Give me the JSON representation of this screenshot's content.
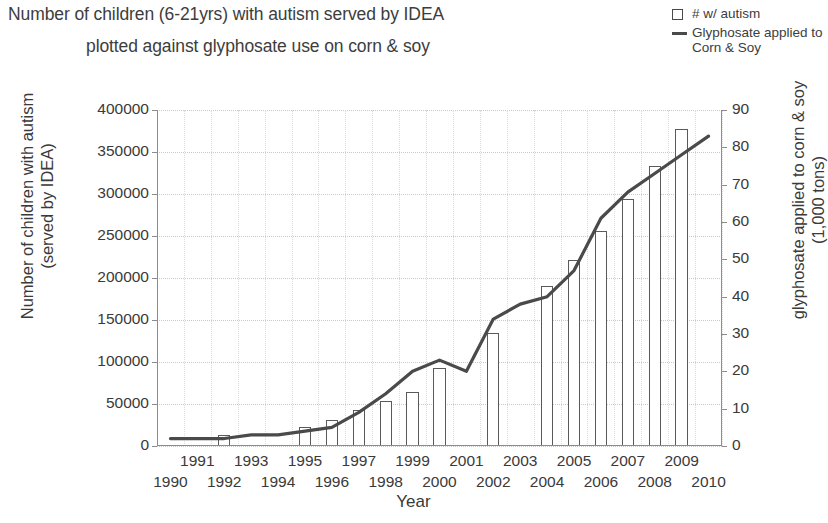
{
  "title": {
    "line1": "Number of children (6-21yrs) with autism served by IDEA",
    "line2": "plotted against glyphosate use on corn & soy"
  },
  "legend": {
    "items": [
      {
        "symbol": "open-square",
        "label": "# w/ autism"
      },
      {
        "symbol": "line",
        "label": "Glyphosate applied to\nCorn & Soy"
      }
    ]
  },
  "axes": {
    "x_title": "Year",
    "y_left_title": "Number of children with autism\n(served by IDEA)",
    "y_right_title": "glyphosate applied to corn & soy\n(1,000 tons)",
    "y_left_ticks": [
      "0",
      "50000",
      "100000",
      "150000",
      "200000",
      "250000",
      "300000",
      "350000",
      "400000"
    ],
    "y_right_ticks": [
      "0",
      "10",
      "20",
      "30",
      "40",
      "50",
      "60",
      "70",
      "80",
      "90"
    ],
    "x_ticks": [
      "1990",
      "1991",
      "1992",
      "1993",
      "1994",
      "1995",
      "1996",
      "1997",
      "1998",
      "1999",
      "2000",
      "2001",
      "2002",
      "2003",
      "2004",
      "2005",
      "2006",
      "2007",
      "2008",
      "2009",
      "2010"
    ]
  },
  "colors": {
    "line": "#4a4a4a",
    "bar_stroke": "#5a5a5a",
    "bar_fill": "#ffffff",
    "grid": "#c9c9c9",
    "axis": "#8c8c8c",
    "text": "#3a3a3a"
  },
  "chart_data": {
    "type": "bar",
    "title": "Number of children (6-21yrs) with autism served by IDEA plotted against glyphosate use on corn & soy",
    "xlabel": "Year",
    "ylabel": "Number of children with autism (served by IDEA)",
    "y2label": "glyphosate applied to corn & soy (1,000 tons)",
    "ylim": [
      0,
      400000
    ],
    "y2lim": [
      0,
      90
    ],
    "grid": true,
    "legend_position": "top-right",
    "categories": [
      "1990",
      "1991",
      "1992",
      "1993",
      "1994",
      "1995",
      "1996",
      "1997",
      "1998",
      "1999",
      "2000",
      "2001",
      "2002",
      "2003",
      "2004",
      "2005",
      "2006",
      "2007",
      "2008",
      "2009",
      "2010"
    ],
    "series": [
      {
        "name": "# w/ autism",
        "type": "bar",
        "axis": "left",
        "values": [
          null,
          null,
          13000,
          null,
          null,
          23000,
          31000,
          43000,
          54000,
          64000,
          93000,
          null,
          134000,
          null,
          190000,
          221000,
          256000,
          294000,
          333000,
          377000,
          null
        ]
      },
      {
        "name": "Glyphosate applied to Corn & Soy",
        "type": "line",
        "axis": "right",
        "values": [
          2,
          2,
          2,
          3,
          3,
          4,
          5,
          9,
          14,
          20,
          23,
          20,
          34,
          38,
          40,
          47,
          61,
          68,
          73,
          78,
          83
        ]
      }
    ]
  }
}
